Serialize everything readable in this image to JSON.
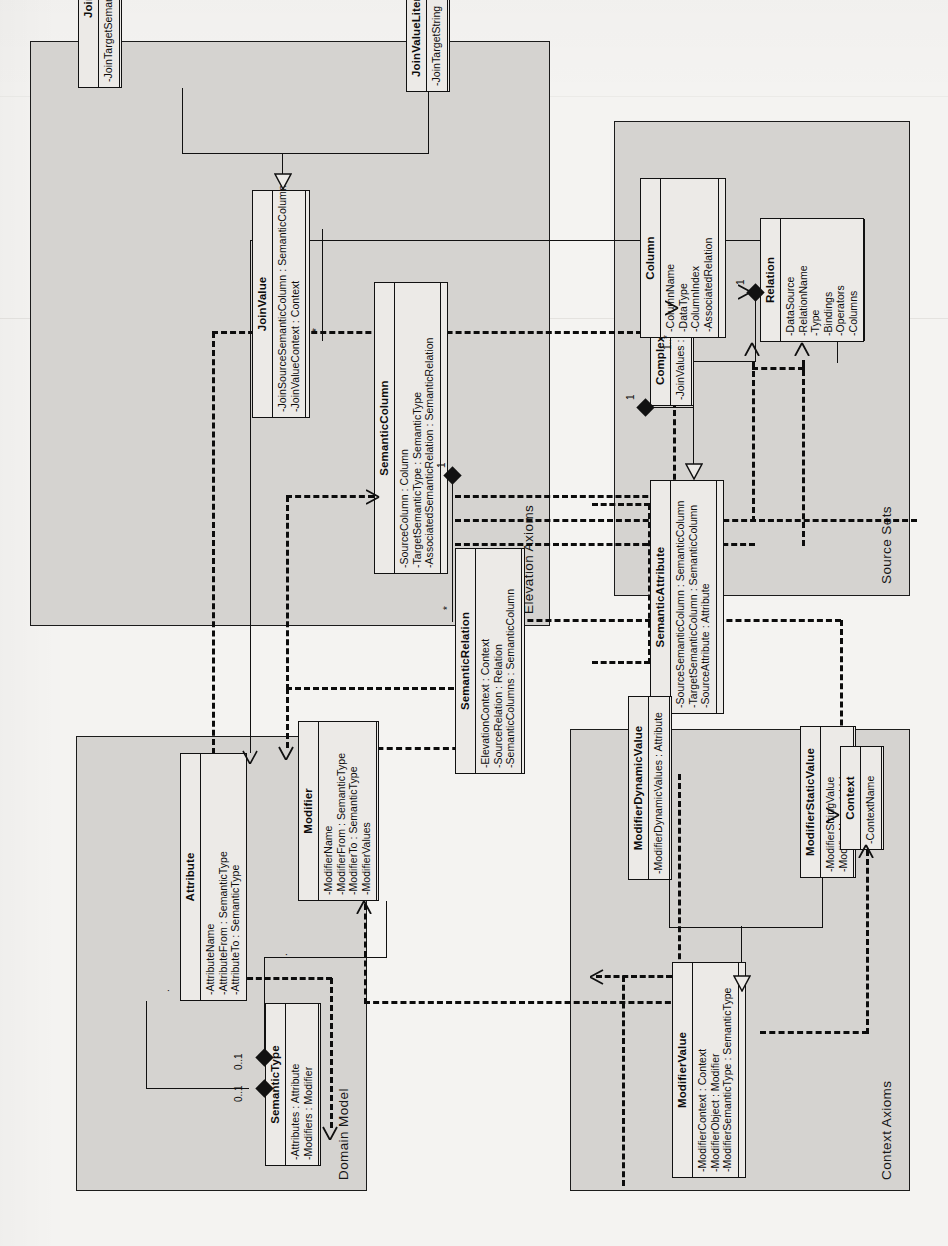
{
  "diagram": {
    "kind": "uml-class-diagram",
    "orientation": "rotated-90-ccw",
    "colors": {
      "page_background": "#f4f3f1",
      "package_fill": "#d5d3d0",
      "class_fill": "#eceae7",
      "stroke": "#111111"
    }
  },
  "packages": [
    {
      "id": "domain_model",
      "label": "Domain Model"
    },
    {
      "id": "elevation_axioms",
      "label": "Elevation Axioms"
    },
    {
      "id": "context_axioms",
      "label": "Context Axioms"
    },
    {
      "id": "source_sets",
      "label": "Source Sets"
    }
  ],
  "classes": [
    {
      "id": "attribute",
      "package": "domain_model",
      "name": "Attribute",
      "attributes": [
        "-AttributeName",
        "-AttributeFrom : SemanticType",
        "-AttributeTo : SemanticType"
      ],
      "operations": []
    },
    {
      "id": "semantic_type",
      "package": "domain_model",
      "name": "SemanticType",
      "attributes": [
        "-Attributes : Attribute",
        "-Modifiers : Modifier"
      ],
      "operations": []
    },
    {
      "id": "modifier",
      "package": "domain_model",
      "name": "Modifier",
      "attributes": [
        "-ModifierName",
        "-ModifierFrom : SemanticType",
        "-ModifierTo : SemanticType",
        "-ModifierValues"
      ],
      "operations": []
    },
    {
      "id": "semantic_column",
      "package": "elevation_axioms",
      "name": "SemanticColumn",
      "attributes": [
        "-SourceColumn : Column",
        "-TargetSemanticType : SemanticType",
        "-AssociatedSemanticRelation : SemanticRelation"
      ],
      "operations": []
    },
    {
      "id": "semantic_relation",
      "package": "elevation_axioms",
      "name": "SemanticRelation",
      "attributes": [
        "-ElevationContext : Context",
        "-SourceRelation : Relation",
        "-SemanticColumns : SemanticColumn"
      ],
      "operations": []
    },
    {
      "id": "semantic_attribute",
      "package": "elevation_axioms",
      "name": "SemanticAttribute",
      "attributes": [
        "-SourceSemanticColumn : SemanticColumn",
        "-TargetSemanticColumn : SemanticColumn",
        "-SourceAttribute : Attribute"
      ],
      "operations": []
    },
    {
      "id": "complex_semantic_attribute",
      "package": "elevation_axioms",
      "name": "ComplexSemanticAttribute",
      "attributes": [
        "-JoinValues : JoinValue"
      ],
      "operations": []
    },
    {
      "id": "join_value",
      "package": "elevation_axioms",
      "name": "JoinValue",
      "attributes": [
        "-JoinSourceSemanticColumn : SemanticColumn",
        "-JoinValueContext : Context"
      ],
      "operations": []
    },
    {
      "id": "join_value_column",
      "package": "elevation_axioms",
      "name": "JoinValueColumn",
      "attributes": [
        "-JoinTargetSemanticColumn : SemanticColumn"
      ],
      "operations": []
    },
    {
      "id": "join_value_literal",
      "package": "elevation_axioms",
      "name": "JoinValueLiteral",
      "attributes": [
        "-JoinTargetString"
      ],
      "operations": []
    },
    {
      "id": "modifier_value",
      "package": "context_axioms",
      "name": "ModifierValue",
      "attributes": [
        "-ModifierContext : Context",
        "-ModifierObject : Modifier",
        "-ModifierSemanticType : SemanticType"
      ],
      "operations": []
    },
    {
      "id": "modifier_dynamic_value",
      "package": "context_axioms",
      "name": "ModifierDynamicValue",
      "attributes": [
        "-ModifierDynamicValues : Attribute"
      ],
      "operations": []
    },
    {
      "id": "modifier_static_value",
      "package": "context_axioms",
      "name": "ModifierStaticValue",
      "attributes": [
        "-ModifierStringValue",
        "-ModifierNumericValue"
      ],
      "operations": []
    },
    {
      "id": "context",
      "package": "context_axioms",
      "name": "Context",
      "attributes": [
        "-ContextName"
      ],
      "operations": []
    },
    {
      "id": "relation",
      "package": "source_sets",
      "name": "Relation",
      "attributes": [
        "-DataSource",
        "-RelationName",
        "-Type",
        "-Bindings",
        "-Operators",
        "-Columns"
      ],
      "operations": []
    },
    {
      "id": "column",
      "package": "source_sets",
      "name": "Column",
      "attributes": [
        "-ColumnName",
        "-DataType",
        "-ColumnIndex",
        "-AssociatedRelation"
      ],
      "operations": []
    }
  ],
  "multiplicities": [
    {
      "id": "st_attr_mult",
      "label": "0..1"
    },
    {
      "id": "st_mod_mult",
      "label": "0..1"
    },
    {
      "id": "sc_star_mult",
      "label": "*"
    },
    {
      "id": "sr_one_mult",
      "label": "1"
    },
    {
      "id": "jv_star_mult",
      "label": "*"
    },
    {
      "id": "csa_one_mult",
      "label": "1"
    },
    {
      "id": "col_many_mult",
      "label": "1..*"
    },
    {
      "id": "rel_one_mult",
      "label": "1"
    },
    {
      "id": "dm_dot_mult_a",
      "label": "."
    },
    {
      "id": "dm_dot_mult_b",
      "label": "."
    }
  ]
}
